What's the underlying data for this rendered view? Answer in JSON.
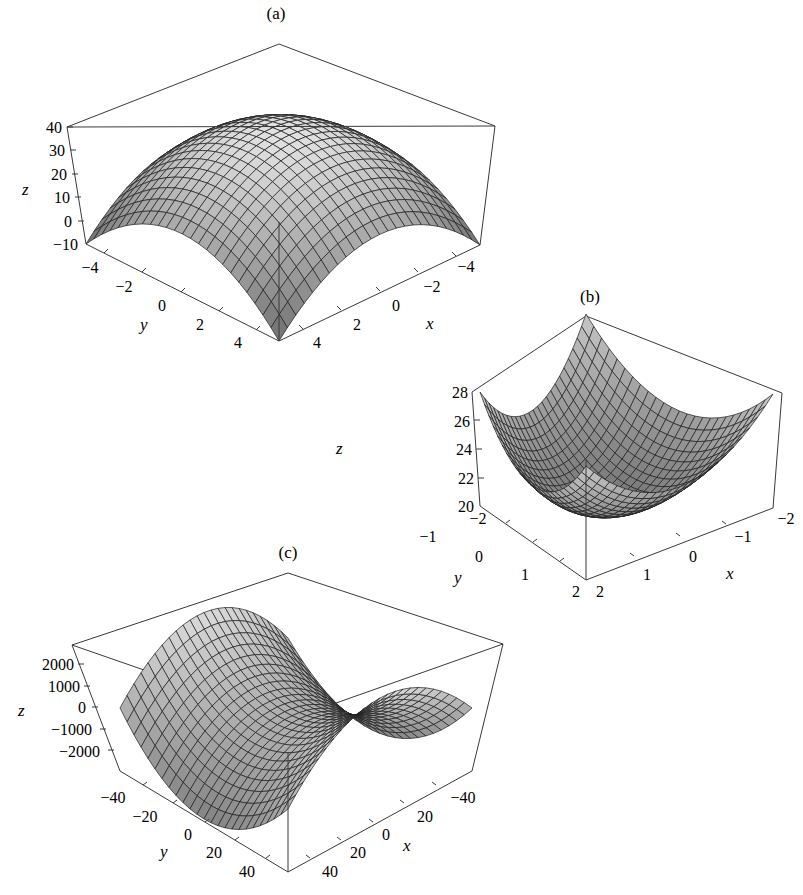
{
  "chart_data": [
    {
      "panel": "(a)",
      "type": "surface3d",
      "title": "(a)",
      "surface": "concave-down paraboloid (dome)",
      "xlabel": "x",
      "ylabel": "y",
      "zlabel": "z",
      "xlim": [
        -5,
        5
      ],
      "ylim": [
        -5,
        5
      ],
      "zlim": [
        -10,
        40
      ],
      "x_ticks": [
        "-4",
        "-2",
        "0",
        "2",
        "4"
      ],
      "y_ticks": [
        "-4",
        "-2",
        "0",
        "2",
        "4"
      ],
      "z_ticks": [
        "40",
        "30",
        "20",
        "10",
        "0",
        "-10"
      ],
      "z_peak": 40,
      "z_corner": -10,
      "grid_lines": 24,
      "grid": false,
      "legend": false
    },
    {
      "panel": "(b)",
      "type": "surface3d",
      "title": "(b)",
      "surface": "concave-up paraboloid (bowl)",
      "xlabel": "x",
      "ylabel": "y",
      "zlabel": "z",
      "xlim": [
        -2,
        2
      ],
      "ylim": [
        -2,
        2
      ],
      "zlim": [
        20,
        28
      ],
      "x_ticks": [
        "-2",
        "-1",
        "0",
        "1",
        "2"
      ],
      "y_ticks": [
        "-2",
        "-1",
        "0",
        "1",
        "2"
      ],
      "z_ticks": [
        "28",
        "26",
        "24",
        "22",
        "20"
      ],
      "z_min": 20,
      "z_corner": 28,
      "grid_lines": 24,
      "grid": false,
      "legend": false
    },
    {
      "panel": "(c)",
      "type": "surface3d",
      "title": "(c)",
      "surface": "saddle",
      "xlabel": "x",
      "ylabel": "y",
      "zlabel": "z",
      "xlim": [
        -50,
        50
      ],
      "ylim": [
        -50,
        50
      ],
      "zlim": [
        -2500,
        2500
      ],
      "x_ticks": [
        "-40",
        "20",
        "0",
        "20",
        "40"
      ],
      "y_ticks": [
        "-40",
        "-20",
        "0",
        "20",
        "40"
      ],
      "z_ticks": [
        "2000",
        "1000",
        "0",
        "-1000",
        "-2000"
      ],
      "grid_lines": 24,
      "grid": false,
      "legend": false
    }
  ],
  "panels": {
    "a": {
      "title": "(a)",
      "z_axis_label": "z",
      "x_axis_label": "x",
      "y_axis_label": "y",
      "z_ticks": [
        "40",
        "30",
        "20",
        "10",
        "0",
        "−10"
      ],
      "y_ticks": [
        "−4",
        "−2",
        "0",
        "2",
        "4"
      ],
      "x_ticks": [
        "−4",
        "−2",
        "0",
        "2",
        "4"
      ]
    },
    "b": {
      "title": "(b)",
      "z_axis_label": "z",
      "x_axis_label": "x",
      "y_axis_label": "y",
      "z_ticks": [
        "28",
        "26",
        "24",
        "22",
        "20"
      ],
      "y_ticks": [
        "−2",
        "−1",
        "0",
        "1",
        "2"
      ],
      "x_ticks": [
        "−2",
        "−1",
        "0",
        "1",
        "2"
      ]
    },
    "c": {
      "title": "(c)",
      "z_axis_label": "z",
      "x_axis_label": "x",
      "y_axis_label": "y",
      "z_ticks": [
        "2000",
        "1000",
        "0",
        "−1000",
        "−2000"
      ],
      "y_ticks": [
        "−40",
        "−20",
        "0",
        "20",
        "40"
      ],
      "x_ticks": [
        "−40",
        "20",
        "0",
        "20",
        "40"
      ]
    }
  },
  "style": {
    "surface_light": "#d6d6d6",
    "surface_dark": "#6e6e6e",
    "mesh_color": "#1e1e1e",
    "box_color": "#3a3a3a",
    "background": "#ffffff"
  }
}
